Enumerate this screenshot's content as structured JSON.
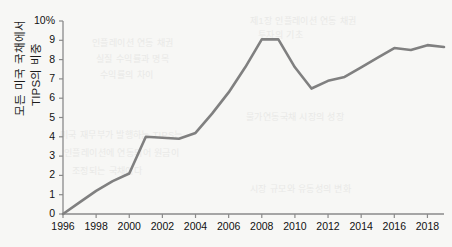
{
  "axis": {
    "y_title_line1": "모든 미국 국채에서",
    "y_title_line2": "TIPS의 비중",
    "y_ticks": [
      "10%",
      "9",
      "8",
      "7",
      "6",
      "5",
      "4",
      "3",
      "2",
      "1",
      "0"
    ],
    "x_ticks": [
      "1996",
      "1998",
      "2000",
      "2002",
      "2004",
      "2006",
      "2008",
      "2010",
      "2012",
      "2014",
      "2016",
      "2018"
    ]
  },
  "style": {
    "line_color": "#808080",
    "axis_color": "#8a8a8a",
    "text_color": "#111111",
    "background": "#f7f7f5"
  },
  "bleed_text": {
    "b1": "제1장 인플레이션 연동 채권",
    "b2": "투자의 기초",
    "b3": "인플레이션 연동 채권",
    "b4": "실질 수익률과 명목",
    "b5": "수익률의 차이",
    "b6": "미국 재무부가 발행하는 TIPS는",
    "b7": "인플레이션에 연동되어 원금이",
    "b8": "조정되는 국채이다",
    "b9": "물가연동국채 시장의 성장",
    "b10": "시장 규모와 유동성의 변화"
  },
  "chart_data": {
    "type": "line",
    "title": "",
    "xlabel": "",
    "ylabel": "모든 미국 국채에서 TIPS의 비중",
    "xlim": [
      1996,
      2019
    ],
    "ylim": [
      0,
      10
    ],
    "ytick_values": [
      0,
      1,
      2,
      3,
      4,
      5,
      6,
      7,
      8,
      9,
      10
    ],
    "xtick_values": [
      1996,
      1998,
      2000,
      2002,
      2004,
      2006,
      2008,
      2010,
      2012,
      2014,
      2016,
      2018
    ],
    "grid": false,
    "legend": null,
    "series": [
      {
        "name": "TIPS 비중",
        "x": [
          1996,
          1997,
          1998,
          1999,
          2000,
          2001,
          2002,
          2003,
          2004,
          2005,
          2006,
          2007,
          2008,
          2009,
          2010,
          2011,
          2012,
          2013,
          2014,
          2015,
          2016,
          2017,
          2018,
          2019
        ],
        "values": [
          0.0,
          0.6,
          1.2,
          1.7,
          2.1,
          4.0,
          3.95,
          3.9,
          4.2,
          5.2,
          6.3,
          7.6,
          9.05,
          9.05,
          7.6,
          6.5,
          6.9,
          7.1,
          7.6,
          8.1,
          8.6,
          8.5,
          8.75,
          8.65
        ]
      }
    ]
  }
}
